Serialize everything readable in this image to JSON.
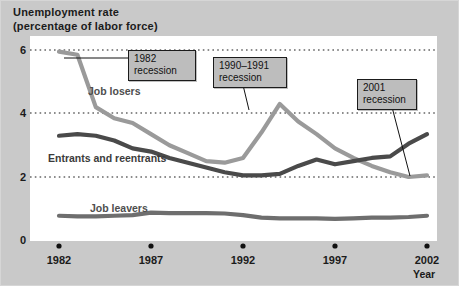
{
  "figure": {
    "title_line1": "Unemployment rate",
    "title_line2": "(percentage of labor force)",
    "background_color": "#c9c9c9",
    "plot_background_color": "#ffffff"
  },
  "axes": {
    "y_ticks": [
      "0",
      "2",
      "4",
      "6"
    ],
    "x_ticks": [
      "1982",
      "1987",
      "1992",
      "1997",
      "2002"
    ],
    "x_axis_name": "Year"
  },
  "series_labels": {
    "job_losers": "Job losers",
    "entrants_line1": "Entrants and",
    "entrants_line2": "reentrants",
    "job_leavers": "Job leavers"
  },
  "callouts": [
    {
      "id": "recession-1982",
      "line1": "1982",
      "line2": "recession"
    },
    {
      "id": "recession-1990-1991",
      "line1": "1990–1991",
      "line2": "recession"
    },
    {
      "id": "recession-2001",
      "line1": "2001",
      "line2": "recession"
    }
  ],
  "chart_data": {
    "type": "line",
    "title": "Unemployment rate (percentage of labor force)",
    "xlabel": "Year",
    "ylabel": "Unemployment rate (percentage of labor force)",
    "xlim": [
      1982,
      2002
    ],
    "ylim": [
      0,
      6
    ],
    "y_ticks": [
      0,
      2,
      4,
      6
    ],
    "x_ticks": [
      1982,
      1987,
      1992,
      1997,
      2002
    ],
    "grid": "horizontal-dotted",
    "legend": "inline-labels",
    "x": [
      1982,
      1983,
      1984,
      1985,
      1986,
      1987,
      1988,
      1989,
      1990,
      1991,
      1992,
      1993,
      1994,
      1995,
      1996,
      1997,
      1998,
      1999,
      2000,
      2001,
      2002
    ],
    "series": [
      {
        "name": "Job losers",
        "color": "#9a9a9a",
        "values": [
          5.95,
          5.85,
          4.2,
          3.85,
          3.7,
          3.35,
          3.0,
          2.75,
          2.5,
          2.45,
          2.6,
          3.4,
          4.3,
          3.75,
          3.35,
          2.9,
          2.6,
          2.35,
          2.15,
          2.0,
          2.05
        ]
      },
      {
        "name": "Entrants and reentrants",
        "color": "#4a4a4a",
        "values": [
          3.3,
          3.35,
          3.3,
          3.15,
          2.9,
          2.8,
          2.6,
          2.45,
          2.3,
          2.15,
          2.05,
          2.05,
          2.1,
          2.35,
          2.55,
          2.4,
          2.5,
          2.6,
          2.65,
          3.05,
          3.35
        ]
      },
      {
        "name": "Job leavers",
        "color": "#6e6e6e",
        "values": [
          0.78,
          0.76,
          0.76,
          0.78,
          0.8,
          0.88,
          0.86,
          0.86,
          0.86,
          0.85,
          0.8,
          0.72,
          0.7,
          0.7,
          0.7,
          0.68,
          0.7,
          0.72,
          0.72,
          0.74,
          0.78
        ]
      }
    ],
    "annotations": [
      {
        "text": "1982 recession",
        "x": 1983,
        "y": 5.85
      },
      {
        "text": "1990–1991 recession",
        "x": 1994,
        "y": 4.3
      },
      {
        "text": "2001 recession",
        "x": 2001,
        "y": 2.0
      }
    ]
  }
}
